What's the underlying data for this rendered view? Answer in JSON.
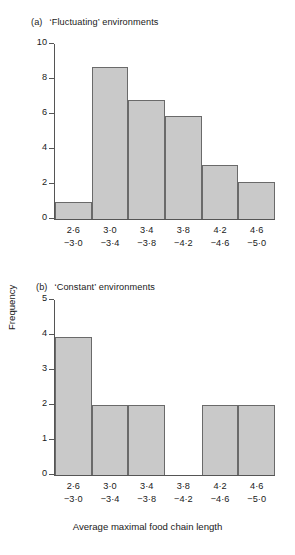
{
  "figure": {
    "axis_x_title": "Average maximal food chain length",
    "axis_y_title": "Frequency",
    "bar_fill_color": "#c9c9c9",
    "bar_edge_color": "#6a6a6a",
    "axis_color": "#555555",
    "text_color": "#1a1a1a"
  },
  "panel_a": {
    "tag": "(a)",
    "title": "‘Fluctuating’ environments"
  },
  "panel_b": {
    "tag": "(b)",
    "title": "‘Constant’ environments"
  },
  "chart_data": [
    {
      "type": "bar",
      "title": "(a) ‘Fluctuating’ environments",
      "xlabel": "Average maximal food chain length",
      "ylabel": "Frequency",
      "categories": [
        "2·6\n−3·0",
        "3·0\n−3·4",
        "3·4\n−3·8",
        "3·8\n−4·2",
        "4·2\n−4·6",
        "4·6\n−5·0"
      ],
      "bin_upper_labels": [
        "2·6",
        "3·0",
        "3·4",
        "3·8",
        "4·2",
        "4·6"
      ],
      "bin_lower_labels": [
        "−3·0",
        "−3·4",
        "−3·8",
        "−4·2",
        "−4·6",
        "−5·0"
      ],
      "values": [
        1,
        8.7,
        6.8,
        5.9,
        3.1,
        2.1
      ],
      "ylim": [
        0,
        10
      ],
      "yticks": [
        0,
        2,
        4,
        6,
        8,
        10
      ],
      "ytick_labels": [
        "0",
        "2",
        "4",
        "6",
        "8",
        "10"
      ],
      "grid": false,
      "legend": "none"
    },
    {
      "type": "bar",
      "title": "(b) ‘Constant’ environments",
      "xlabel": "Average maximal food chain length",
      "ylabel": "Frequency",
      "categories": [
        "2·6\n−3·0",
        "3·0\n−3·4",
        "3·4\n−3·8",
        "3·8\n−4·2",
        "4·2\n−4·6",
        "4·6\n−5·0"
      ],
      "bin_upper_labels": [
        "2·6",
        "3·0",
        "3·4",
        "3·8",
        "4·2",
        "4·6"
      ],
      "bin_lower_labels": [
        "−3·0",
        "−3·4",
        "−3·8",
        "−4·2",
        "−4·6",
        "−5·0"
      ],
      "values": [
        3.95,
        2,
        2,
        0,
        2,
        2
      ],
      "ylim": [
        0,
        5
      ],
      "yticks": [
        0,
        1,
        2,
        3,
        4,
        5
      ],
      "ytick_labels": [
        "0",
        "1",
        "2",
        "3",
        "4",
        "5"
      ],
      "grid": false,
      "legend": "none"
    }
  ]
}
